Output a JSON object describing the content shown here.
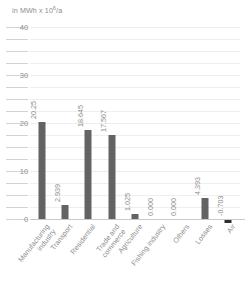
{
  "chart_data": {
    "type": "bar",
    "title": "",
    "subtitle": "",
    "ylabel": "in MWh x 10⁶/a",
    "xlabel": "",
    "ylim": [
      0,
      40
    ],
    "ytick_step": 10,
    "minor_gridline_step": 2.5,
    "grid": true,
    "legend": "none",
    "bar_color": "#636363",
    "negative_bar_color": "#2f2f2f",
    "categories": [
      "Manufacturing industry",
      "Transport",
      "Residential",
      "Trade and commerce",
      "Agriculture",
      "Fishing industry",
      "Others",
      "Losses",
      "Air"
    ],
    "values": [
      20.25,
      2.939,
      18.645,
      17.567,
      1.025,
      0.0,
      0.0,
      4.393,
      -0.703
    ],
    "value_labels": [
      "20.25",
      "2.939",
      "18.645",
      "17.567",
      "1.025",
      "0.000",
      "0.000",
      "4.393",
      "-0.703"
    ],
    "ytick_labels": [
      "40",
      "30",
      "20",
      "10",
      "0"
    ],
    "ytick_values": [
      40,
      30,
      20,
      10,
      0
    ],
    "category_lines": [
      [
        "Manufacturing",
        "industry"
      ],
      [
        "Transport",
        ""
      ],
      [
        "Residential",
        ""
      ],
      [
        "Trade and",
        "commerce"
      ],
      [
        "Agriculture",
        ""
      ],
      [
        "Fishing industry",
        ""
      ],
      [
        "Others",
        ""
      ],
      [
        "Losses",
        ""
      ],
      [
        "Air",
        ""
      ]
    ]
  },
  "axis_title": {
    "prefix": "in MWh x 10",
    "exponent": "6",
    "suffix": "/a"
  }
}
